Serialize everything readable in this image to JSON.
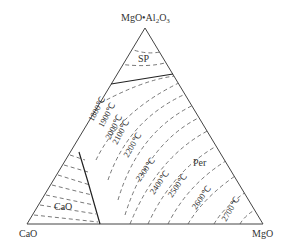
{
  "diagram": {
    "type": "ternary-phase-diagram",
    "vertices": {
      "top": "MgO·Al2O3",
      "left": "CaO",
      "right": "MgO"
    },
    "vertex_labels": {
      "top_main": "MgO•Al",
      "top_sub1": "2",
      "top_mid": "O",
      "top_sub2": "3",
      "left": "CaO",
      "right": "MgO"
    },
    "phase_fields": {
      "sp": "SP",
      "cao": "CaO",
      "per": "Per"
    },
    "isotherms": [
      {
        "label": "1800℃"
      },
      {
        "label": "1900℃"
      },
      {
        "label": "2000℃"
      },
      {
        "label": "2100℃"
      },
      {
        "label": "2200℃"
      },
      {
        "label": "2300℃"
      },
      {
        "label": "2400℃"
      },
      {
        "label": "2500℃"
      },
      {
        "label": "2600℃"
      },
      {
        "label": "2700℃"
      }
    ],
    "colors": {
      "line": "#333333",
      "dash": "#555555"
    }
  }
}
